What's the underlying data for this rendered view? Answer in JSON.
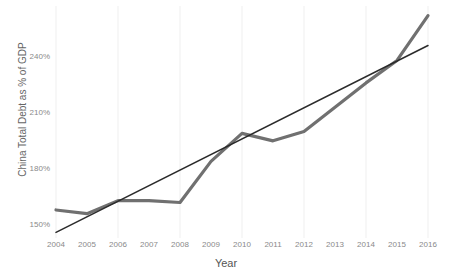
{
  "chart_data": {
    "type": "line",
    "title": "",
    "xlabel": "Year",
    "ylabel": "China Total Debt as % of GDP",
    "x": [
      2004,
      2005,
      2006,
      2007,
      2008,
      2009,
      2010,
      2011,
      2012,
      2013,
      2014,
      2015,
      2016
    ],
    "xtick_labels": [
      "2004",
      "2005",
      "2006",
      "2007",
      "2008",
      "2009",
      "2010",
      "2011",
      "2012",
      "2013",
      "2014",
      "2015",
      "2016"
    ],
    "ytick_labels": [
      "150%",
      "180%",
      "210%",
      "240%"
    ],
    "ytick_values": [
      150,
      180,
      210,
      240
    ],
    "xlim": [
      2004,
      2016
    ],
    "ylim": [
      143,
      265
    ],
    "grid": "vertical-faint",
    "legend": "none",
    "series": [
      {
        "name": "China Total Debt as % of GDP",
        "kind": "observed",
        "color": "#707070",
        "width": 3.2,
        "values": [
          158,
          156,
          163,
          163,
          162,
          184,
          199,
          195,
          200,
          213,
          226,
          238,
          262
        ]
      },
      {
        "name": "Linear trend",
        "kind": "trendline",
        "color": "#2b2b2b",
        "width": 1.5,
        "x_endpoints": [
          2004,
          2016
        ],
        "y_endpoints": [
          146,
          246
        ]
      }
    ]
  }
}
